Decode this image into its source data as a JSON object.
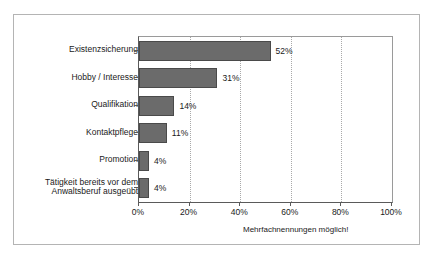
{
  "chart_data": {
    "type": "bar",
    "orientation": "horizontal",
    "title": "",
    "xlabel": "",
    "ylabel": "",
    "categories": [
      "Existenzsicherung",
      "Hobby / Interesse",
      "Qualifikation",
      "Kontaktpflege",
      "Promotion",
      "Tätigkeit bereits vor dem\nAnwaltsberuf ausgeübt"
    ],
    "values": [
      52,
      31,
      14,
      11,
      4,
      4
    ],
    "data_labels": [
      "52%",
      "31%",
      "14%",
      "11%",
      "4%",
      "4%"
    ],
    "xlim": [
      0,
      100
    ],
    "xticks": [
      0,
      20,
      40,
      60,
      80,
      100
    ],
    "xtick_labels": [
      "0%",
      "20%",
      "40%",
      "60%",
      "80%",
      "100%"
    ],
    "gridlines": [
      20,
      40,
      60,
      80
    ],
    "grid": true,
    "legend": null,
    "annotation": "Mehrfachnennungen möglich!",
    "bar_color": "#6b6b6b",
    "bar_edge_color": "#4a4a4a",
    "grid_color": "#a9a9a9",
    "axis_color": "#5a5a5a",
    "frame_color": "#b4b4b4"
  }
}
